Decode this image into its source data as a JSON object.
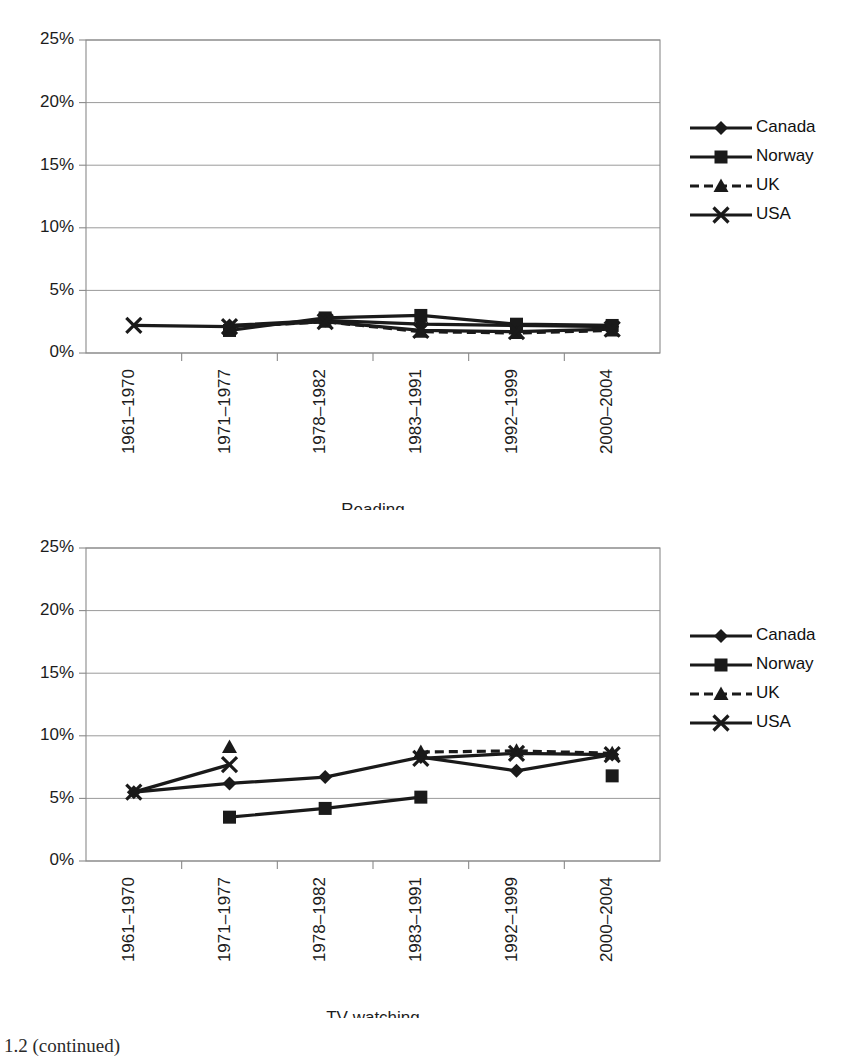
{
  "page": {
    "caption": "1.2  (continued)"
  },
  "axis": {
    "y_ticks": [
      "0%",
      "5%",
      "10%",
      "15%",
      "20%",
      "25%"
    ],
    "y_tick_values": [
      0,
      5,
      10,
      15,
      20,
      25
    ],
    "x_categories": [
      "1961–1970",
      "1971–1977",
      "1978–1982",
      "1983–1991",
      "1992–1999",
      "2000–2004"
    ]
  },
  "legend": {
    "entries": [
      {
        "label": "Canada",
        "marker": "diamond",
        "dashed": false
      },
      {
        "label": "Norway",
        "marker": "square",
        "dashed": false
      },
      {
        "label": "UK",
        "marker": "triangle",
        "dashed": true
      },
      {
        "label": "USA",
        "marker": "cross",
        "dashed": false
      }
    ]
  },
  "chart_data": [
    {
      "id": "reading",
      "type": "line",
      "title": "Reading",
      "xlabel": "Reading",
      "ylabel": "",
      "ylim": [
        0,
        25
      ],
      "grid": true,
      "legend_position": "right",
      "categories": [
        "1961–1970",
        "1971–1977",
        "1978–1982",
        "1983–1991",
        "1992–1999",
        "2000–2004"
      ],
      "series": [
        {
          "name": "Canada",
          "marker": "diamond",
          "dashed": false,
          "values": [
            null,
            2.2,
            2.6,
            2.3,
            2.2,
            2.1
          ]
        },
        {
          "name": "Norway",
          "marker": "square",
          "dashed": false,
          "values": [
            null,
            1.8,
            2.8,
            3.0,
            2.3,
            2.2
          ]
        },
        {
          "name": "UK",
          "marker": "triangle",
          "dashed": true,
          "values": [
            null,
            2.1,
            2.5,
            1.7,
            1.6,
            1.8
          ]
        },
        {
          "name": "USA",
          "marker": "cross",
          "dashed": false,
          "values": [
            2.2,
            2.1,
            2.5,
            1.8,
            1.7,
            1.9
          ]
        }
      ]
    },
    {
      "id": "tv-watching",
      "type": "line",
      "title": "TV watching",
      "xlabel": "TV watching",
      "ylabel": "",
      "ylim": [
        0,
        25
      ],
      "grid": true,
      "legend_position": "right",
      "categories": [
        "1961–1970",
        "1971–1977",
        "1978–1982",
        "1983–1991",
        "1992–1999",
        "2000–2004"
      ],
      "series": [
        {
          "name": "Canada",
          "marker": "diamond",
          "dashed": false,
          "values": [
            5.5,
            6.2,
            6.7,
            8.3,
            7.2,
            8.5
          ]
        },
        {
          "name": "Norway",
          "marker": "square",
          "dashed": false,
          "values": [
            null,
            3.5,
            4.2,
            5.1,
            null,
            6.8
          ]
        },
        {
          "name": "UK",
          "marker": "triangle",
          "dashed": true,
          "values": [
            null,
            9.1,
            null,
            8.7,
            8.8,
            8.6
          ]
        },
        {
          "name": "USA",
          "marker": "cross",
          "dashed": false,
          "values": [
            5.5,
            7.7,
            null,
            8.2,
            8.6,
            8.5
          ]
        }
      ]
    }
  ],
  "colors": {
    "ink": "#1a1a1a",
    "grid": "#9a9a9a",
    "axis": "#8a8a8a",
    "background": "#ffffff"
  }
}
